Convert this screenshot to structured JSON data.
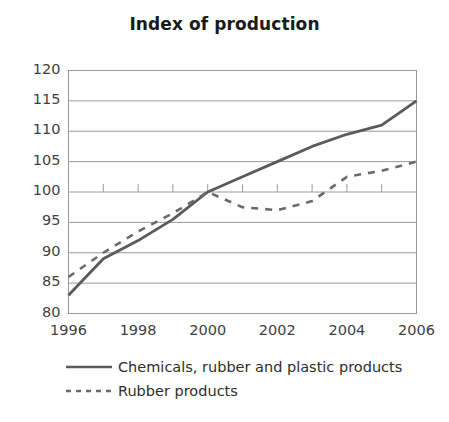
{
  "chart_data": {
    "type": "line",
    "title": "Index of production",
    "xlabel": "",
    "ylabel": "",
    "xlim": [
      1996,
      2006
    ],
    "ylim": [
      80,
      120
    ],
    "yticks": [
      80,
      85,
      90,
      95,
      100,
      105,
      110,
      115,
      120
    ],
    "xticks": [
      1996,
      1997,
      1998,
      1999,
      2000,
      2001,
      2002,
      2003,
      2004,
      2005,
      2006
    ],
    "xticklabels": [
      "1996",
      "",
      "1998",
      "",
      "2000",
      "",
      "2002",
      "",
      "2004",
      "",
      "2006"
    ],
    "xticklabels_shown": [
      "1996",
      "1998",
      "2000",
      "2002",
      "2004",
      "2006"
    ],
    "grid": "horizontal",
    "legend_position": "below",
    "x": [
      1996,
      1997,
      1998,
      1999,
      2000,
      2001,
      2002,
      2003,
      2004,
      2005,
      2006
    ],
    "series": [
      {
        "name": "Chemicals, rubber and plastic products",
        "style": "solid",
        "color": "#5a5a5a",
        "values": [
          83,
          89,
          92,
          95.5,
          100,
          102.5,
          105,
          107.5,
          109.5,
          111,
          115
        ]
      },
      {
        "name": "Rubber products",
        "style": "dashed",
        "color": "#6a6a6a",
        "values": [
          86,
          90,
          93.5,
          96.5,
          100,
          97.5,
          97,
          98.5,
          102.5,
          103.5,
          105
        ]
      }
    ]
  },
  "legend": {
    "items": [
      {
        "label": "Chemicals, rubber and plastic products",
        "style": "solid"
      },
      {
        "label": "Rubber products",
        "style": "dashed"
      }
    ]
  }
}
